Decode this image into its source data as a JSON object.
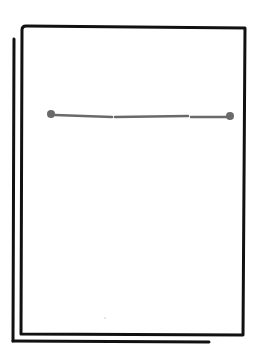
{
  "illustration": {
    "label": "Sketch of stacked document pages with a horizontal divider line",
    "colors": {
      "background": "#ffffff",
      "outline": "#111111",
      "divider": "#6a6a6a",
      "speck": "#c8c8c8"
    },
    "back_page": {
      "left_edge": {
        "x1": 14,
        "y1": 39,
        "x2": 13,
        "y2": 341
      },
      "bottom_edge": {
        "x1": 13,
        "y1": 341,
        "x2": 209,
        "y2": 342
      }
    },
    "front_page": {
      "corners": {
        "top_left": [
          22,
          26
        ],
        "top_right": [
          245,
          28
        ],
        "bottom_right": [
          243,
          335
        ],
        "bottom_left": [
          21,
          334
        ]
      }
    },
    "divider_line": {
      "start_dot": {
        "x": 51,
        "y": 114,
        "r": 4
      },
      "end_dot": {
        "x": 230,
        "y": 116,
        "r": 4
      },
      "segments": [
        {
          "x1": 55,
          "y1": 115,
          "x2": 112,
          "y2": 117
        },
        {
          "x1": 115,
          "y1": 117,
          "x2": 188,
          "y2": 116
        },
        {
          "x1": 191,
          "y1": 117,
          "x2": 229,
          "y2": 117
        }
      ]
    }
  }
}
